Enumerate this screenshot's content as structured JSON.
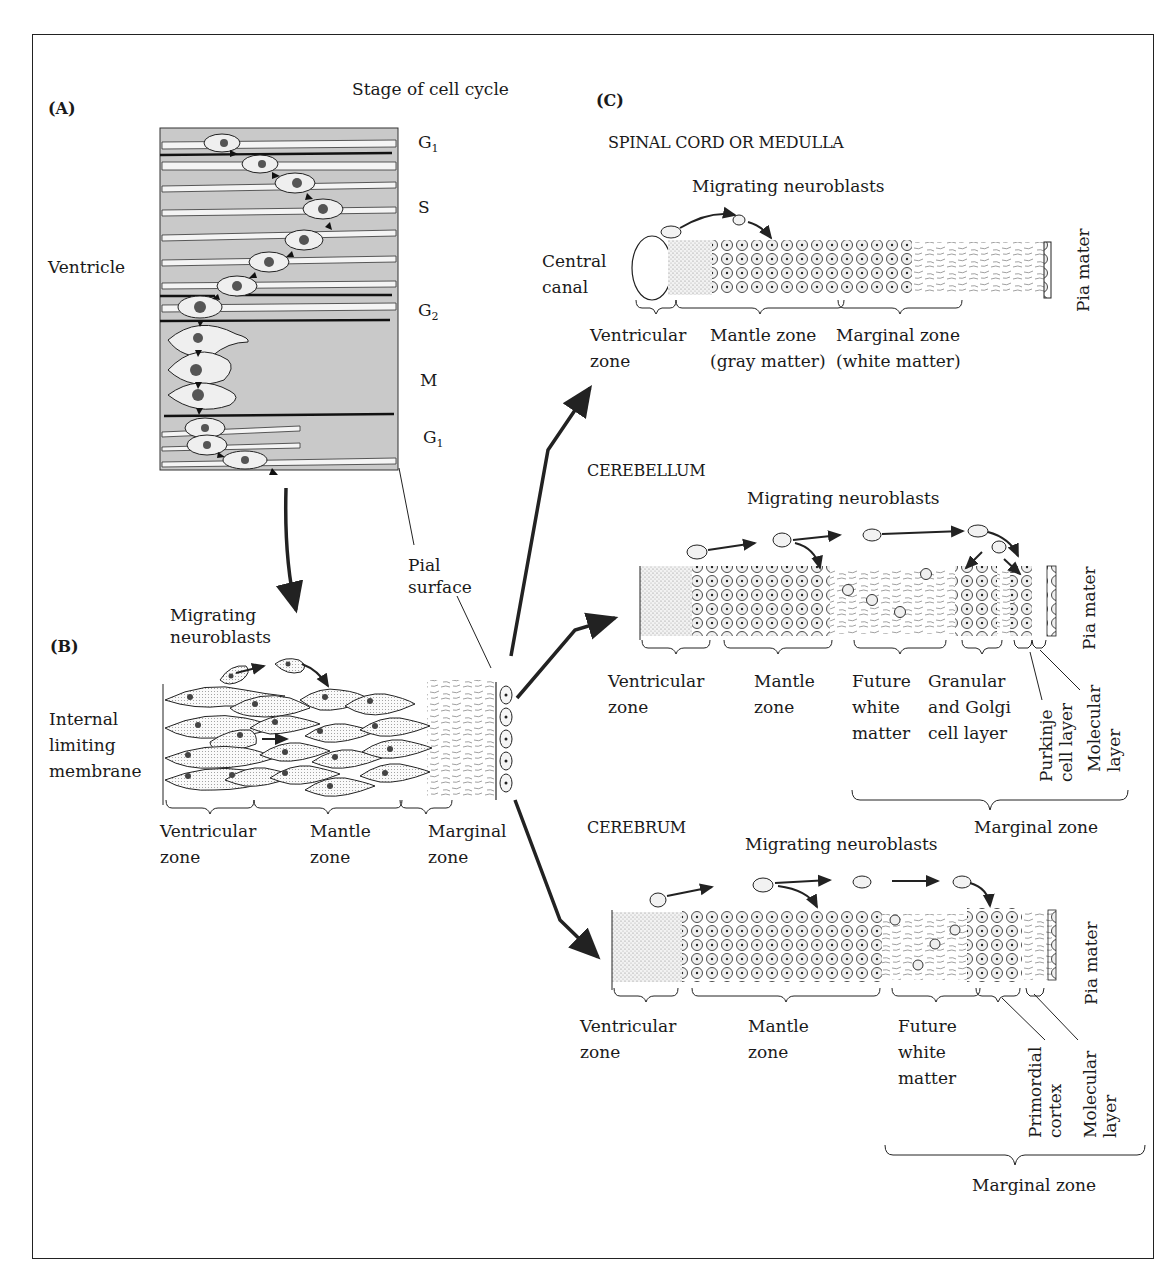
{
  "figure": {
    "panels": {
      "A": {
        "tag": "(A)",
        "title": "Stage of cell cycle",
        "left_label": "Ventricle",
        "stages": [
          {
            "letter": "G",
            "sub": "1"
          },
          {
            "letter": "S",
            "sub": ""
          },
          {
            "letter": "G",
            "sub": "2"
          },
          {
            "letter": "M",
            "sub": ""
          },
          {
            "letter": "G",
            "sub": "1"
          }
        ],
        "pial_label_line1": "Pial",
        "pial_label_line2": "surface"
      },
      "B": {
        "tag": "(B)",
        "migrating_line1": "Migrating",
        "migrating_line2": "neuroblasts",
        "membrane_line1": "Internal",
        "membrane_line2": "limiting",
        "membrane_line3": "membrane",
        "zones": [
          {
            "line1": "Ventricular",
            "line2": "zone"
          },
          {
            "line1": "Mantle",
            "line2": "zone"
          },
          {
            "line1": "Marginal",
            "line2": "zone"
          }
        ]
      },
      "C": {
        "tag": "(C)",
        "spinal": {
          "title": "SPINAL CORD OR MEDULLA",
          "migrating": "Migrating neuroblasts",
          "canal_line1": "Central",
          "canal_line2": "canal",
          "pia": "Pia mater",
          "zones": [
            {
              "line1": "Ventricular",
              "line2": "zone"
            },
            {
              "line1": "Mantle zone",
              "line2": "(gray matter)"
            },
            {
              "line1": "Marginal zone",
              "line2": "(white matter)"
            }
          ]
        },
        "cerebellum": {
          "title": "CEREBELLUM",
          "migrating": "Migrating neuroblasts",
          "pia": "Pia mater",
          "zones": [
            {
              "line1": "Ventricular",
              "line2": "zone"
            },
            {
              "line1": "Mantle",
              "line2": "zone"
            },
            {
              "line1": "Future",
              "line2": "white",
              "line3": "matter"
            },
            {
              "line1": "Granular",
              "line2": "and Golgi",
              "line3": "cell layer"
            }
          ],
          "vertical_labels": [
            {
              "line1": "Purkinje",
              "line2": "cell layer"
            },
            {
              "line1": "Molecular",
              "line2": "layer"
            }
          ],
          "marginal_zone": "Marginal zone"
        },
        "cerebrum": {
          "title": "CEREBRUM",
          "migrating": "Migrating neuroblasts",
          "pia": "Pia mater",
          "zones": [
            {
              "line1": "Ventricular",
              "line2": "zone"
            },
            {
              "line1": "Mantle",
              "line2": "zone"
            },
            {
              "line1": "Future",
              "line2": "white",
              "line3": "matter"
            }
          ],
          "vertical_labels": [
            {
              "line1": "Primordial",
              "line2": "cortex"
            },
            {
              "line1": "Molecular",
              "line2": "layer"
            }
          ],
          "marginal_zone": "Marginal zone"
        }
      }
    },
    "colors": {
      "ink": "#1a1a1a",
      "shade": "#c9c9c9",
      "paper": "#ffffff"
    }
  }
}
